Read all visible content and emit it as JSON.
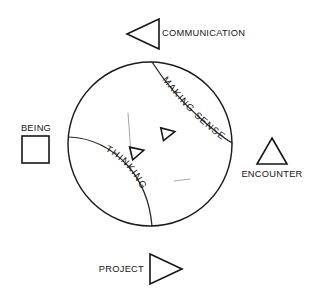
{
  "diagram": {
    "circle": {
      "center_x": 150,
      "center_y": 144,
      "radius": 82,
      "stroke_color": "#1c1c1c"
    },
    "inner_arcs": [
      {
        "name": "making-sense-arc",
        "label": "MAKING SENSE",
        "path": "M 152 62 C 166 84, 182 102, 200 118 C 212 129, 224 138, 232 143"
      },
      {
        "name": "thinking-arc",
        "label": "THINKING",
        "path": "M 69 137 C 92 138, 112 148, 128 166 C 142 182, 150 203, 152 226"
      }
    ],
    "inner_markers": [
      {
        "name": "inner-triangle-upper",
        "cx": 168,
        "cy": 133,
        "rotation": -12
      },
      {
        "name": "inner-triangle-lower",
        "cx": 137,
        "cy": 152,
        "rotation": -14
      }
    ],
    "faint_marks": [
      {
        "name": "faint-vertical-mark",
        "path": "M 128 113 L 131 154"
      },
      {
        "name": "faint-short-mark",
        "path": "M 174 181 L 190 179"
      }
    ],
    "nodes": [
      {
        "id": "communication",
        "label": "COMMUNICATION",
        "marker": "triangle-left",
        "marker_name": "communication-triangle-icon",
        "label_x": 162,
        "label_y": 36,
        "label_anchor": "start"
      },
      {
        "id": "encounter",
        "label": "ENCOUNTER",
        "marker": "triangle-up",
        "marker_name": "encounter-triangle-icon",
        "label_x": 272,
        "label_y": 177,
        "label_anchor": "middle"
      },
      {
        "id": "project",
        "label": "PROJECT",
        "marker": "triangle-right",
        "marker_name": "project-triangle-icon",
        "label_x": 144,
        "label_y": 272,
        "label_anchor": "end"
      },
      {
        "id": "being",
        "label": "BEING",
        "marker": "square",
        "marker_name": "being-square-icon",
        "label_x": 36,
        "label_y": 131,
        "label_anchor": "middle"
      }
    ],
    "colors": {
      "ink": "#1c1c1c",
      "faint_ink": "#8d8d8d",
      "background": "#ffffff"
    }
  }
}
